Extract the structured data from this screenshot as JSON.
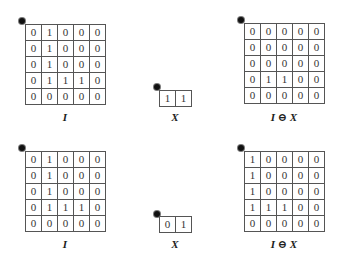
{
  "figures": [
    {
      "row": "top",
      "image": {
        "label": "I",
        "cells": [
          [
            0,
            1,
            0,
            0,
            0
          ],
          [
            0,
            1,
            0,
            0,
            0
          ],
          [
            0,
            1,
            0,
            0,
            0
          ],
          [
            0,
            1,
            1,
            1,
            0
          ],
          [
            0,
            0,
            0,
            0,
            0
          ]
        ]
      },
      "structuring_element": {
        "label": "X",
        "cells": [
          [
            1,
            1
          ]
        ]
      },
      "result": {
        "label": "I ⊖ X",
        "cells": [
          [
            0,
            0,
            0,
            0,
            0
          ],
          [
            0,
            0,
            0,
            0,
            0
          ],
          [
            0,
            0,
            0,
            0,
            0
          ],
          [
            0,
            1,
            1,
            0,
            0
          ],
          [
            0,
            0,
            0,
            0,
            0
          ]
        ]
      }
    },
    {
      "row": "bottom",
      "image": {
        "label": "I",
        "cells": [
          [
            0,
            1,
            0,
            0,
            0
          ],
          [
            0,
            1,
            0,
            0,
            0
          ],
          [
            0,
            1,
            0,
            0,
            0
          ],
          [
            0,
            1,
            1,
            1,
            0
          ],
          [
            0,
            0,
            0,
            0,
            0
          ]
        ]
      },
      "structuring_element": {
        "label": "X",
        "cells": [
          [
            0,
            1
          ]
        ]
      },
      "result": {
        "label": "I ⊖ X",
        "cells": [
          [
            1,
            0,
            0,
            0,
            0
          ],
          [
            1,
            0,
            0,
            0,
            0
          ],
          [
            1,
            0,
            0,
            0,
            0
          ],
          [
            1,
            1,
            1,
            0,
            0
          ],
          [
            0,
            0,
            0,
            0,
            0
          ]
        ]
      }
    }
  ],
  "origin_marker": "asterisk-dot",
  "colors": {
    "grid_line": "#555555",
    "text": "#333333",
    "background": "#ffffff"
  }
}
